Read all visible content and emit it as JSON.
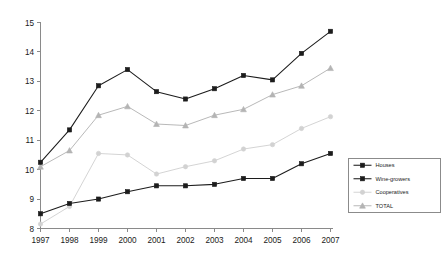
{
  "chart_data": {
    "type": "line",
    "title": "",
    "subtitle": "",
    "xlabel": "",
    "ylabel": "",
    "categories": [
      "1997",
      "1998",
      "1999",
      "2000",
      "2001",
      "2002",
      "2003",
      "2004",
      "2005",
      "2006",
      "2007"
    ],
    "xlim": [
      "1997",
      "2007"
    ],
    "ylim": [
      8,
      15
    ],
    "yticks": [
      8,
      9,
      10,
      11,
      12,
      13,
      14,
      15
    ],
    "ytick_labels": [
      "8",
      "9",
      "10",
      "11",
      "12",
      "13",
      "14",
      "15"
    ],
    "grid": false,
    "legend_position": "bottom-right",
    "series": [
      {
        "name": "Houses",
        "color": "#1c1c1c",
        "marker": "square",
        "marker_fill": "#1c1c1c",
        "values": [
          10.25,
          11.35,
          12.85,
          13.4,
          12.65,
          12.4,
          12.75,
          13.2,
          13.05,
          13.95,
          14.7
        ]
      },
      {
        "name": "Wine-growers",
        "color": "#1c1c1c",
        "marker": "square",
        "marker_fill": "#1c1c1c",
        "values": [
          8.5,
          8.85,
          9.0,
          9.25,
          9.45,
          9.45,
          9.5,
          9.7,
          9.7,
          10.2,
          10.55
        ]
      },
      {
        "name": "Cooperatives",
        "color": "#d2d2d2",
        "marker": "circle",
        "marker_fill": "#d2d2d2",
        "values": [
          8.15,
          8.75,
          10.55,
          10.5,
          9.85,
          10.1,
          10.3,
          10.7,
          10.85,
          11.4,
          11.8
        ]
      },
      {
        "name": "TOTAL",
        "color": "#b4b4b4",
        "marker": "triangle",
        "marker_fill": "#b4b4b4",
        "values": [
          10.1,
          10.65,
          11.85,
          12.15,
          11.55,
          11.5,
          11.85,
          12.05,
          12.55,
          12.85,
          13.45
        ]
      }
    ]
  },
  "legend": {
    "items": [
      {
        "label": "Houses"
      },
      {
        "label": "Wine-growers"
      },
      {
        "label": "Cooperatives"
      },
      {
        "label": "TOTAL"
      }
    ]
  }
}
